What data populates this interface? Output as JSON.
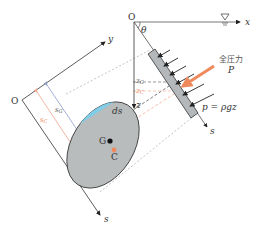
{
  "diagram": {
    "colors": {
      "axis": "#333333",
      "plate": "#b4b8ba",
      "ellipse": "#b9bcbd",
      "strip": "#7fcde6",
      "accent_orange": "#f08a5d",
      "dim_blue": "#8c9cc8",
      "dim_orange": "#f0a58a",
      "dashed": "#999999"
    },
    "top_frame": {
      "origin_label": "O",
      "x_axis_label": "x",
      "z_axis_label": "z",
      "s_axis_label": "s",
      "angle_label": "θ",
      "free_surface_symbol": "▽",
      "zG_label": "zG",
      "zC_label": "zC",
      "pressure_label": "p = ρgz",
      "total_force_label_jp": "全圧力",
      "total_force_symbol": "P"
    },
    "left_frame": {
      "origin_label": "O",
      "y_axis_label": "y",
      "s_axis_label": "s",
      "sG_label": "sG",
      "sC_label": "sC",
      "strip_label": "ds",
      "centroid_label": "G",
      "pressure_center_label": "C"
    }
  }
}
